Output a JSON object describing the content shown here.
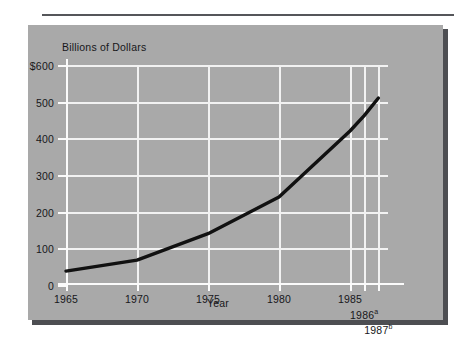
{
  "figure": {
    "panel_background": "#a9a9a9",
    "gridline_color": "#f2f2f2",
    "series_color": "#111111",
    "text_color": "#17171a"
  },
  "chart_data": {
    "type": "line",
    "title": "",
    "ylabel": "Billions of Dollars",
    "xlabel": "Year",
    "grid": true,
    "legend": "none",
    "ylim": [
      0,
      600
    ],
    "xlim": [
      1965,
      1987
    ],
    "ytick_labels": [
      "$600",
      "500",
      "400",
      "300",
      "200",
      "100",
      "0"
    ],
    "ytick_values": [
      600,
      500,
      400,
      300,
      200,
      100,
      0
    ],
    "xtick_labels": [
      "1965",
      "1970",
      "1975",
      "1980",
      "1985",
      "1986",
      "1987"
    ],
    "xtick_superscripts": [
      "",
      "",
      "",
      "",
      "",
      "a",
      "b"
    ],
    "xtick_values": [
      1965,
      1970,
      1975,
      1980,
      1985,
      1986,
      1987
    ],
    "x": [
      1965,
      1970,
      1975,
      1980,
      1985,
      1986,
      1987
    ],
    "values": [
      38,
      68,
      140,
      240,
      420,
      462,
      510
    ],
    "series": [
      {
        "name": "Billions of Dollars",
        "x": [
          1965,
          1970,
          1975,
          1980,
          1985,
          1986,
          1987
        ],
        "values": [
          38,
          68,
          140,
          240,
          420,
          462,
          510
        ]
      }
    ]
  }
}
